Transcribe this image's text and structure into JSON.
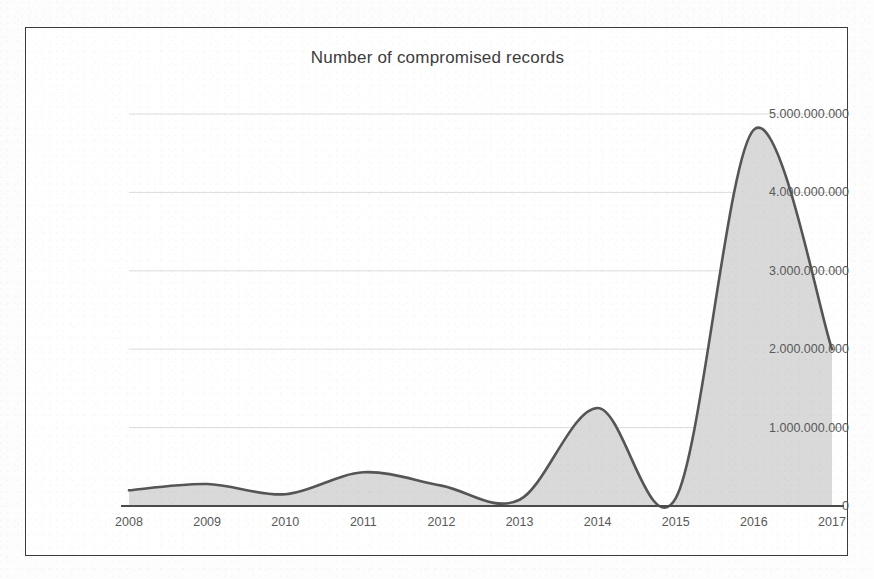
{
  "chart_data": {
    "type": "area",
    "title": "Number of compromised records",
    "xlabel": "",
    "ylabel": "",
    "x": [
      2008,
      2009,
      2010,
      2011,
      2012,
      2013,
      2014,
      2015,
      2016,
      2017
    ],
    "categories": [
      "2008",
      "2009",
      "2010",
      "2011",
      "2012",
      "2013",
      "2014",
      "2015",
      "2016",
      "2017"
    ],
    "values": [
      200000000,
      280000000,
      150000000,
      430000000,
      260000000,
      80000000,
      1250000000,
      100000000,
      4800000000,
      2000000000
    ],
    "series": [
      {
        "name": "Number of compromised records",
        "values": [
          200000000,
          280000000,
          150000000,
          430000000,
          260000000,
          80000000,
          1250000000,
          100000000,
          4800000000,
          2000000000
        ]
      }
    ],
    "ylim": [
      0,
      5000000000
    ],
    "xlim": [
      2008,
      2017
    ],
    "y_ticks": [
      0,
      1000000000,
      2000000000,
      3000000000,
      4000000000,
      5000000000
    ],
    "y_tick_labels": [
      "0",
      "1.000.000.000",
      "2.000.000.000",
      "3.000.000.000",
      "4.000.000.000",
      "5.000.000.000"
    ],
    "x_tick_labels": [
      "2008",
      "2009",
      "2010",
      "2011",
      "2012",
      "2013",
      "2014",
      "2015",
      "2016",
      "2017"
    ],
    "grid": true,
    "grid_axis": "y",
    "legend": false,
    "legend_position": "none",
    "interpolation": "smooth-spline",
    "colors": {
      "area_fill": "#d9d9d9",
      "line_stroke": "#555555",
      "grid_line": "#dcdcdc",
      "axis_line": "#4a4a4a",
      "tick_label": "#585858",
      "title": "#3c3c3c",
      "frame_border": "#3a3a3a",
      "background": "#ffffff"
    }
  }
}
